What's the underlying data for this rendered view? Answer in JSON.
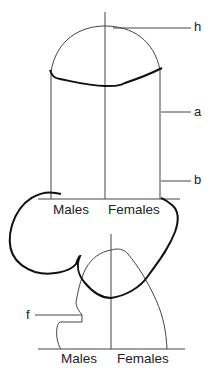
{
  "diagram": {
    "top_panel": {
      "x_labels": [
        "Males",
        "Females"
      ],
      "callouts": {
        "h": "h",
        "a": "a",
        "b": "b"
      }
    },
    "bottom_panel": {
      "x_labels": [
        "Males",
        "Females"
      ],
      "callouts": {
        "f": "f"
      }
    },
    "colors": {
      "line": "#333333",
      "annotation_stroke": "#111111",
      "background": "#ffffff"
    }
  }
}
